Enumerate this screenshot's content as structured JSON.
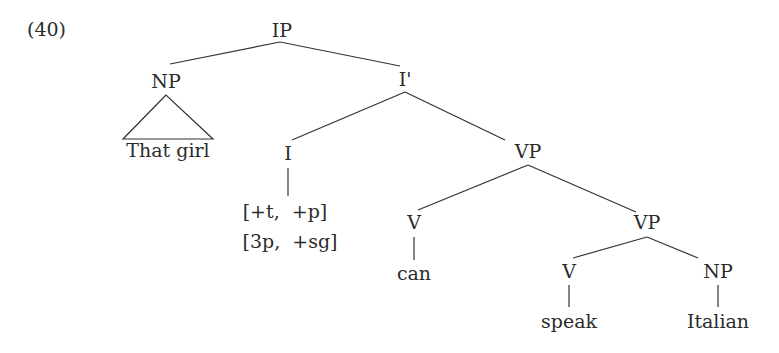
{
  "example_number": "(40)",
  "nodes": {
    "ip": "IP",
    "np_subj": "NP",
    "np_subj_text": "That girl",
    "i_bar": "I'",
    "i": "I",
    "i_feat1": "[+t,  +p]",
    "i_feat2": "[3p,  +sg]",
    "vp1": "VP",
    "v1": "V",
    "v1_word": "can",
    "vp2": "VP",
    "v2": "V",
    "v2_word": "speak",
    "np_obj": "NP",
    "np_obj_word": "Italian"
  },
  "colors": {
    "text": "#2b2b2b",
    "line": "#333333",
    "background": "#ffffff"
  }
}
